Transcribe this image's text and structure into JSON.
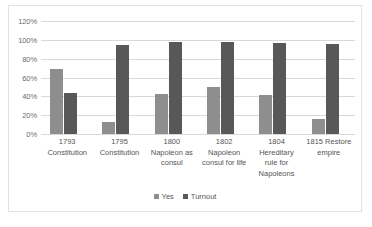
{
  "chart_data": {
    "type": "bar",
    "title": "",
    "xlabel": "",
    "ylabel": "",
    "ylim": [
      0,
      120
    ],
    "ytick_labels": [
      "120%",
      "100%",
      "80%",
      "60%",
      "40%",
      "20%",
      "0%"
    ],
    "ytick_values": [
      120,
      100,
      80,
      60,
      40,
      20,
      0
    ],
    "grid": true,
    "legend_position": "bottom",
    "categories": [
      "1793 Constitution",
      "1795 Constitution",
      "1800 Napoleon as consul",
      "1802 Napoleon consul for life",
      "1804 Hereditary rule for Napoleons",
      "1815 Restore empire"
    ],
    "category_lines": [
      [
        "1793",
        "Constitution"
      ],
      [
        "1795",
        "Constitution"
      ],
      [
        "1800",
        "Napoleon as",
        "consul"
      ],
      [
        "1802",
        "Napoleon",
        "consul for life"
      ],
      [
        "1804",
        "Hereditary",
        "rule for",
        "Napoleons"
      ],
      [
        "1815 Restore",
        "empire"
      ]
    ],
    "series": [
      {
        "name": "Yes",
        "color": "#8e8e8e",
        "values": [
          69,
          13,
          42,
          50,
          41,
          16
        ]
      },
      {
        "name": "Turnout",
        "color": "#585858",
        "values": [
          44,
          94,
          98,
          98,
          97,
          96
        ]
      }
    ]
  },
  "legend": {
    "items": [
      {
        "label": "Yes"
      },
      {
        "label": "Turnout"
      }
    ]
  },
  "colors": {
    "yes": "#8e8e8e",
    "turnout": "#585858",
    "gridline": "#d9d9d9",
    "border": "#e2e2e2",
    "text": "#555555",
    "background": "#ffffff"
  }
}
